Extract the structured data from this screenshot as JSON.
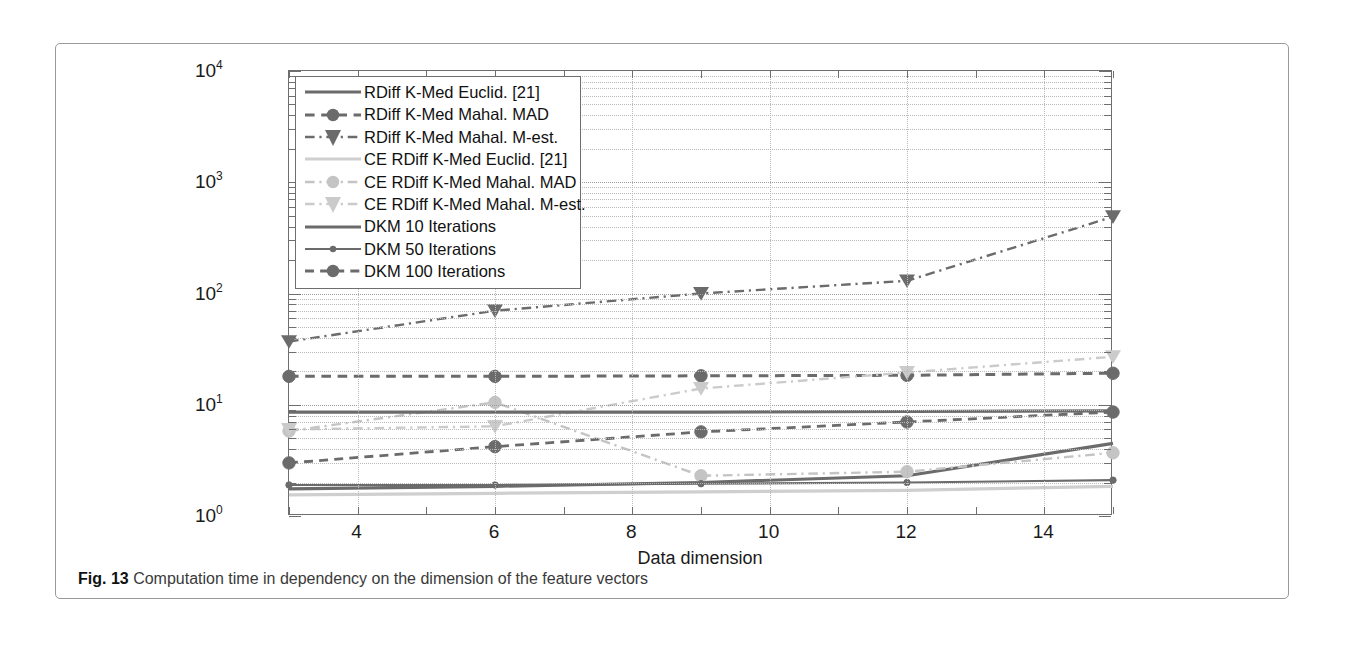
{
  "figure": {
    "caption_label": "Fig. 13",
    "caption_text": "Computation time in dependency on the dimension of the feature vectors"
  },
  "chart_data": {
    "type": "line",
    "title": "",
    "xlabel": "Data dimension",
    "ylabel": "Computation time",
    "xlim": [
      3,
      15
    ],
    "ylim": [
      1,
      10000
    ],
    "yscale": "log",
    "xscale": "linear",
    "grid": true,
    "legend_position": "upper-left",
    "xticks": [
      4,
      6,
      8,
      10,
      12,
      14
    ],
    "ytick_labels": [
      "10^0",
      "10^1",
      "10^2",
      "10^3",
      "10^4"
    ],
    "ytick_values": [
      1,
      10,
      100,
      1000,
      10000
    ],
    "x": [
      3,
      6,
      9,
      12,
      15
    ],
    "series": [
      {
        "name": "RDiff K-Med Euclid. [21]",
        "color": "#6b6b6b",
        "style": "solid",
        "marker": "none",
        "width": 3.2,
        "values": [
          1.75,
          1.85,
          2.0,
          2.3,
          4.5
        ]
      },
      {
        "name": "RDiff K-Med Mahal. MAD",
        "color": "#6b6b6b",
        "style": "dashed",
        "marker": "circle",
        "width": 3.0,
        "values": [
          18.0,
          18.0,
          18.2,
          18.4,
          19.2
        ]
      },
      {
        "name": "RDiff K-Med Mahal. M-est.",
        "color": "#6b6b6b",
        "style": "dashdot",
        "marker": "triangle-down",
        "width": 2.4,
        "values": [
          37.0,
          70.0,
          100.0,
          130.0,
          490.0
        ]
      },
      {
        "name": "CE RDiff K-Med Euclid. [21]",
        "color": "#cfcfcf",
        "style": "solid",
        "marker": "none",
        "width": 3.2,
        "values": [
          1.55,
          1.6,
          1.65,
          1.7,
          1.85
        ]
      },
      {
        "name": "CE RDiff K-Med Mahal. MAD",
        "color": "#c4c4c4",
        "style": "dashdot",
        "marker": "circle",
        "width": 2.4,
        "values": [
          5.8,
          10.5,
          2.3,
          2.5,
          3.7
        ]
      },
      {
        "name": "CE RDiff K-Med Mahal. M-est.",
        "color": "#cbcbcb",
        "style": "dashdot",
        "marker": "triangle-down",
        "width": 2.4,
        "values": [
          6.0,
          6.4,
          14.0,
          19.5,
          27.0
        ]
      },
      {
        "name": "DKM 10 Iterations",
        "color": "#6b6b6b",
        "style": "solid",
        "marker": "none",
        "width": 3.2,
        "values": [
          8.6,
          8.6,
          8.6,
          8.7,
          8.8
        ]
      },
      {
        "name": "DKM 50 Iterations",
        "color": "#6b6b6b",
        "style": "solid",
        "marker": "dot",
        "width": 2.2,
        "values": [
          1.9,
          1.9,
          1.95,
          2.0,
          2.1
        ]
      },
      {
        "name": "DKM 100 Iterations",
        "color": "#6b6b6b",
        "style": "dashed",
        "marker": "circle",
        "width": 2.8,
        "values": [
          3.0,
          4.2,
          5.7,
          7.0,
          8.6
        ]
      }
    ]
  }
}
